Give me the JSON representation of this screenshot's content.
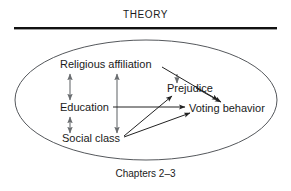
{
  "figure": {
    "title": "THEORY",
    "caption": "Chapters 2–3",
    "colors": {
      "rule": "#111111",
      "ellipse_stroke": "#55585c",
      "arrow": "#222222",
      "arrow_gray": "#6a6d70",
      "text": "#1a1a1a",
      "background": "#ffffff"
    },
    "boundary": {
      "shape": "ellipse",
      "center_x": 146,
      "center_y": 100,
      "radius_x": 131,
      "radius_y": 60
    },
    "nodes": [
      {
        "id": "religious_affiliation",
        "label": "Religious affiliation",
        "x": 60,
        "y": 68
      },
      {
        "id": "prejudice",
        "label": "Prejudice",
        "x": 167,
        "y": 91
      },
      {
        "id": "education",
        "label": "Education",
        "x": 60,
        "y": 111
      },
      {
        "id": "voting_behavior",
        "label": "Voting behavior",
        "x": 189,
        "y": 111
      },
      {
        "id": "social_class",
        "label": "Social class",
        "x": 62,
        "y": 141
      }
    ],
    "edges": [
      {
        "from": "religious_affiliation",
        "to": "education",
        "type": "double-headed-vertical"
      },
      {
        "from": "education",
        "to": "social_class",
        "type": "double-headed-vertical"
      },
      {
        "from": "religious_affiliation",
        "to": "social_class",
        "type": "double-headed-vertical-long"
      },
      {
        "from": "religious_affiliation",
        "to": "prejudice",
        "type": "single-headed"
      },
      {
        "from": "religious_affiliation",
        "to": "voting_behavior",
        "type": "single-headed-diagonal"
      },
      {
        "from": "prejudice",
        "to": "voting_behavior",
        "type": "single-headed-diagonal"
      },
      {
        "from": "education",
        "to": "voting_behavior",
        "type": "single-headed-horizontal"
      },
      {
        "from": "social_class",
        "to": "prejudice",
        "type": "single-headed-diagonal"
      },
      {
        "from": "social_class",
        "to": "voting_behavior",
        "type": "single-headed-diagonal"
      }
    ]
  }
}
